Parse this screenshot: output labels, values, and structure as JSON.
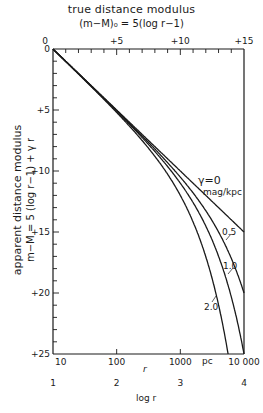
{
  "chart_data": {
    "type": "line",
    "title": "true distance modulus",
    "top_axis": {
      "label": "true distance modulus",
      "formula": "(m−M)₀ = 5(log r−1)",
      "ticks": [
        0,
        5,
        10,
        15
      ],
      "tick_labels": [
        "0",
        "+5",
        "+10",
        "+15"
      ],
      "range": [
        0,
        15
      ],
      "minor_step": 1
    },
    "ylabel": "apparent distance modulus",
    "ylabel_formula": "m−M = 5 (log r−1) + γ r",
    "yticks": [
      0,
      5,
      10,
      15,
      20,
      25
    ],
    "ytick_labels": [
      "0",
      "+5",
      "+10",
      "+15",
      "+20",
      "+25"
    ],
    "ylim": [
      0,
      25
    ],
    "y_inverted": true,
    "xlabel": "r",
    "x_unit": "pc",
    "x_scale": "log",
    "xticks": [
      10,
      100,
      1000,
      10000
    ],
    "xtick_labels": [
      "10",
      "100",
      "1000",
      "10 000"
    ],
    "xlim": [
      10,
      10000
    ],
    "second_xlabel": "log r",
    "second_xticks": [
      "1",
      "2",
      "3",
      "4"
    ],
    "grid": false,
    "series": [
      {
        "name": "γ = 0 mag/kpc",
        "gamma": 0,
        "x": [
          10,
          100,
          1000,
          10000
        ],
        "y": [
          0,
          5,
          10,
          15
        ]
      },
      {
        "name": "0.5",
        "gamma": 0.5,
        "x": [
          10,
          100,
          1000,
          3000,
          5000,
          10000
        ],
        "y": [
          0.005,
          5.05,
          10.5,
          13.89,
          16.49,
          20.0
        ]
      },
      {
        "name": "1.0",
        "gamma": 1.0,
        "x": [
          10,
          100,
          1000,
          3000,
          5000,
          10000
        ],
        "y": [
          0.01,
          5.1,
          11.0,
          15.39,
          18.99,
          25.0
        ]
      },
      {
        "name": "2.0",
        "gamma": 2.0,
        "x": [
          10,
          100,
          1000,
          3000,
          5000,
          5650
        ],
        "y": [
          0.02,
          5.2,
          12.0,
          18.39,
          23.99,
          25.0
        ]
      }
    ],
    "annotations": [
      "γ=0",
      "mag/kpc",
      "0.5",
      "1.0",
      "2.0",
      "pc"
    ]
  },
  "labels": {
    "top_title": "true distance modulus",
    "top_formula": "(m−M)₀ = 5(log r−1)",
    "y_title": "apparent distance modulus",
    "y_formula": "m−M = 5 (log r−1) + γ r",
    "x_title": "r",
    "x_unit": "pc",
    "logr_title": "log r",
    "gamma0": "γ=0",
    "gamma_unit": "mag/kpc",
    "g05": "0.5",
    "g10": "1.0",
    "g20": "2.0"
  }
}
